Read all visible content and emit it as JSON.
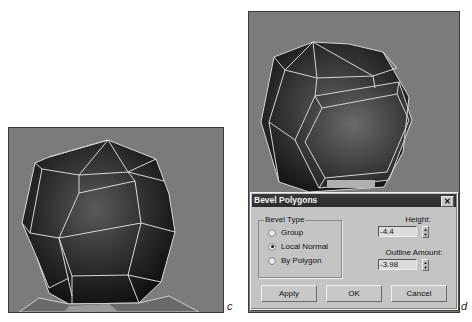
{
  "panels": {
    "c": {
      "label": "c"
    },
    "d": {
      "label": "d"
    }
  },
  "dialog": {
    "title": "Bevel Polygons",
    "close_icon": "close-icon",
    "bevel_type": {
      "legend": "Bevel Type",
      "options": [
        {
          "label": "Group",
          "checked": false
        },
        {
          "label": "Local Normal",
          "checked": true
        },
        {
          "label": "By Polygon",
          "checked": false
        }
      ]
    },
    "height": {
      "label": "Height:",
      "value": "-4.4"
    },
    "outline_amount": {
      "label": "Outline Amount:",
      "value": "-3.98"
    },
    "buttons": {
      "apply": "Apply",
      "ok": "OK",
      "cancel": "Cancel"
    }
  },
  "colors": {
    "viewport_bg": "#7b7b7b",
    "dialog_bg": "#c4c4c4",
    "titlebar_bg": "#2e2e2e"
  }
}
